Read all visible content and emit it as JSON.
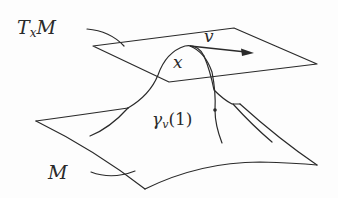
{
  "diagram": {
    "labels": {
      "tangent_space_base": "T",
      "tangent_space_sub": "x",
      "tangent_space_tail": "M",
      "vector": "v",
      "point": "x",
      "geodesic_base": "γ",
      "geodesic_sub": "v",
      "geodesic_arg": "(1)",
      "manifold": "M"
    },
    "colors": {
      "stroke": "#2a2a2a",
      "background": "#fdfdfd"
    }
  }
}
